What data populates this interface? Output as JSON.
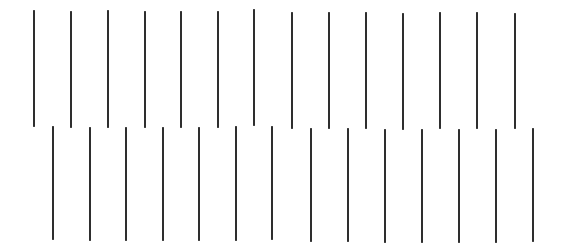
{
  "figure": {
    "width": 566,
    "height": 247,
    "background": "#ffffff",
    "line_color": "#2e2e2e",
    "line_width": 2.5
  },
  "rows": [
    {
      "name": "top-row",
      "count": 14,
      "lines": [
        {
          "x": 34,
          "y1": 10,
          "y2": 127
        },
        {
          "x": 71,
          "y1": 11,
          "y2": 128
        },
        {
          "x": 108,
          "y1": 10,
          "y2": 128
        },
        {
          "x": 145,
          "y1": 11,
          "y2": 128
        },
        {
          "x": 181,
          "y1": 11,
          "y2": 128
        },
        {
          "x": 218,
          "y1": 11,
          "y2": 128
        },
        {
          "x": 254,
          "y1": 9,
          "y2": 126
        },
        {
          "x": 292,
          "y1": 12,
          "y2": 129
        },
        {
          "x": 329,
          "y1": 12,
          "y2": 129
        },
        {
          "x": 366,
          "y1": 12,
          "y2": 129
        },
        {
          "x": 403,
          "y1": 13,
          "y2": 130
        },
        {
          "x": 440,
          "y1": 12,
          "y2": 129
        },
        {
          "x": 477,
          "y1": 12,
          "y2": 129
        },
        {
          "x": 515,
          "y1": 13,
          "y2": 129
        }
      ]
    },
    {
      "name": "bottom-row",
      "count": 14,
      "lines": [
        {
          "x": 53,
          "y1": 126,
          "y2": 240
        },
        {
          "x": 90,
          "y1": 127,
          "y2": 241
        },
        {
          "x": 126,
          "y1": 127,
          "y2": 241
        },
        {
          "x": 163,
          "y1": 127,
          "y2": 241
        },
        {
          "x": 199,
          "y1": 127,
          "y2": 241
        },
        {
          "x": 236,
          "y1": 126,
          "y2": 241
        },
        {
          "x": 272,
          "y1": 126,
          "y2": 240
        },
        {
          "x": 311,
          "y1": 128,
          "y2": 242
        },
        {
          "x": 348,
          "y1": 128,
          "y2": 242
        },
        {
          "x": 385,
          "y1": 129,
          "y2": 243
        },
        {
          "x": 422,
          "y1": 129,
          "y2": 243
        },
        {
          "x": 459,
          "y1": 129,
          "y2": 243
        },
        {
          "x": 496,
          "y1": 129,
          "y2": 243
        },
        {
          "x": 533,
          "y1": 128,
          "y2": 242
        }
      ]
    }
  ]
}
